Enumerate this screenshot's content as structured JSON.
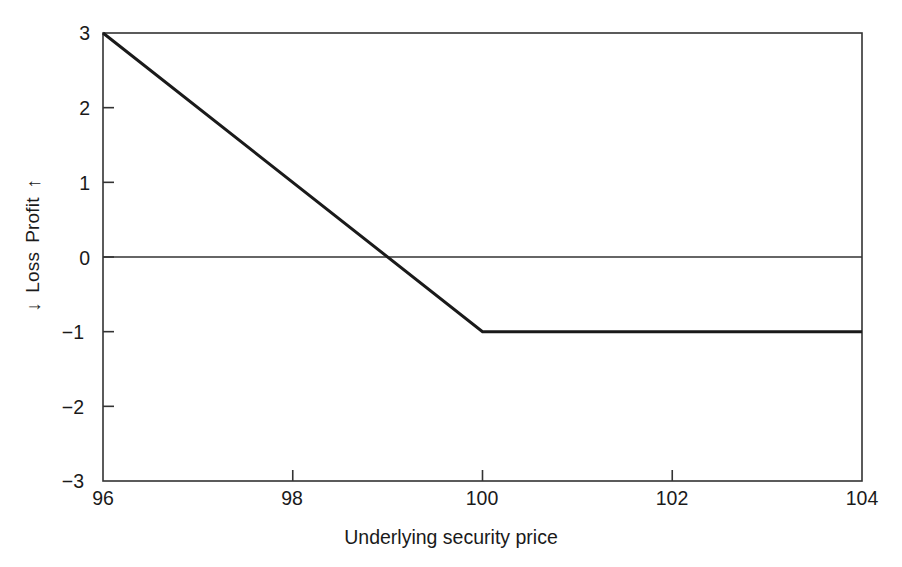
{
  "chart_data": {
    "type": "line",
    "title": "",
    "subtitle": "",
    "xlabel": "Underlying security price",
    "ylabel": "← Loss    Profit →",
    "ylabel_parts": {
      "up_arrow": "↑",
      "profit": "Profit",
      "loss": "Loss",
      "down_arrow": "↓"
    },
    "xlim": [
      96,
      104
    ],
    "ylim": [
      -3,
      3
    ],
    "xticks": [
      96,
      98,
      100,
      102,
      104
    ],
    "xtick_labels": [
      "96",
      "98",
      "100",
      "102",
      "104"
    ],
    "yticks": [
      3,
      2,
      1,
      0,
      -1,
      -2,
      -3
    ],
    "ytick_labels": [
      "3",
      "2",
      "1",
      "0",
      "−1",
      "−2",
      "−3"
    ],
    "grid": false,
    "legend": "none",
    "zero_line": {
      "y": 0,
      "visible": true,
      "color": "#333333"
    },
    "frame": {
      "visible": true,
      "color": "#333333"
    },
    "tick_direction": "in",
    "series": [
      {
        "name": "Profit/Loss at expiration",
        "color": "#1a1a1a",
        "linewidth": 3,
        "x": [
          96,
          100,
          104
        ],
        "values": [
          3,
          -1,
          -1
        ],
        "points": [
          {
            "x": 96,
            "y": 3
          },
          {
            "x": 97,
            "y": 2
          },
          {
            "x": 98,
            "y": 1
          },
          {
            "x": 99,
            "y": 0
          },
          {
            "x": 100,
            "y": -1
          },
          {
            "x": 101,
            "y": -1
          },
          {
            "x": 102,
            "y": -1
          },
          {
            "x": 103,
            "y": -1
          },
          {
            "x": 104,
            "y": -1
          }
        ],
        "breakeven": 99,
        "kink": {
          "x": 100,
          "y": -1
        }
      }
    ]
  },
  "geometry": {
    "plot_left": 103,
    "plot_right": 862,
    "plot_top": 33,
    "plot_bottom": 481
  }
}
